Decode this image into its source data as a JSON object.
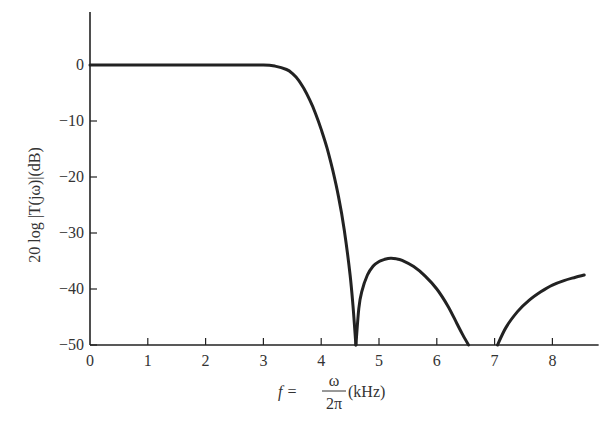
{
  "chart_data": {
    "type": "line",
    "title": "",
    "xlabel": "f = ω/2π (kHz)",
    "xlabel_parts": {
      "lhs": "f =",
      "numerator": "ω",
      "denominator": "2π",
      "unit": "(kHz)"
    },
    "ylabel": "20 log |T(jω)|(dB)",
    "xlim": [
      0,
      8.8
    ],
    "ylim": [
      -50,
      10
    ],
    "x_ticks": [
      0,
      1,
      2,
      3,
      4,
      5,
      6,
      7,
      8
    ],
    "x_tick_labels": [
      "0",
      "1",
      "2",
      "3",
      "4",
      "5",
      "6",
      "7",
      "8"
    ],
    "y_ticks": [
      0,
      -10,
      -20,
      -30,
      -40,
      -50
    ],
    "y_tick_labels": [
      "0",
      "−10",
      "−20",
      "−30",
      "−40",
      "−50"
    ],
    "grid": false,
    "legend": null,
    "series": [
      {
        "name": "20 log |T(jω)|",
        "color": "#222222",
        "segments": [
          {
            "x": [
              0,
              0.5,
              1.0,
              1.5,
              2.0,
              2.5,
              3.0,
              3.2,
              3.4,
              3.5,
              3.6,
              3.7,
              3.8,
              3.9,
              4.0,
              4.1,
              4.2,
              4.3,
              4.4,
              4.5,
              4.55,
              4.6
            ],
            "y": [
              0,
              0,
              0,
              0,
              0,
              0,
              0,
              -0.2,
              -0.8,
              -1.5,
              -2.6,
              -4.2,
              -6.2,
              -8.6,
              -11.5,
              -14.8,
              -18.8,
              -23.5,
              -29.5,
              -37.5,
              -43,
              -50
            ]
          },
          {
            "x": [
              4.6,
              4.65,
              4.7,
              4.8,
              4.9,
              5.0,
              5.1,
              5.2,
              5.3,
              5.4,
              5.6,
              5.8,
              6.0,
              6.2,
              6.35,
              6.45,
              6.55
            ],
            "y": [
              -50,
              -43.5,
              -40.5,
              -37.5,
              -35.9,
              -35.1,
              -34.7,
              -34.5,
              -34.6,
              -34.9,
              -36.0,
              -37.7,
              -40.0,
              -43.2,
              -46.2,
              -48.2,
              -50
            ]
          },
          {
            "x": [
              7.05,
              7.2,
              7.4,
              7.6,
              7.8,
              8.0,
              8.2,
              8.4,
              8.55
            ],
            "y": [
              -50,
              -46.8,
              -44.0,
              -42.0,
              -40.5,
              -39.3,
              -38.5,
              -37.9,
              -37.5
            ]
          }
        ]
      }
    ],
    "annotations": []
  }
}
